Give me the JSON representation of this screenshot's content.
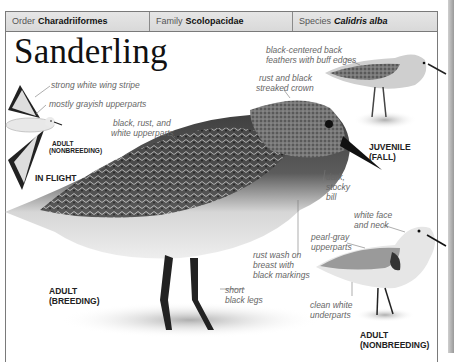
{
  "header": {
    "order_label": "Order",
    "order_value": "Charadriiformes",
    "family_label": "Family",
    "family_value": "Scolopacidae",
    "species_label": "Species",
    "species_value": "Calidris alba"
  },
  "title": "Sanderling",
  "figures": {
    "in_flight": {
      "caption_age": "ADULT",
      "caption_plumage": "(NONBREEDING)",
      "caption": "IN FLIGHT",
      "labels": [
        "strong white wing stripe",
        "mostly grayish upperparts"
      ]
    },
    "adult_breeding": {
      "caption_line1": "ADULT",
      "caption_line2": "(BREEDING)",
      "labels": {
        "upperparts_1": "black, rust, and",
        "upperparts_2": "white upperparts",
        "crown_1": "rust and black",
        "crown_2": "streaked crown",
        "bill_1": "dark,",
        "bill_2": "stocky",
        "bill_3": "bill",
        "breast_1": "rust wash on",
        "breast_2": "breast with",
        "breast_3": "black markings",
        "legs_1": "short",
        "legs_2": "black legs"
      }
    },
    "juvenile": {
      "caption_line1": "JUVENILE",
      "caption_line2": "(FALL)",
      "labels": {
        "back_1": "black-centered back",
        "back_2": "feathers with buff edges"
      }
    },
    "adult_nonbreeding": {
      "caption_line1": "ADULT",
      "caption_line2": "(NONBREEDING)",
      "labels": {
        "face_1": "white face",
        "face_2": "and neck",
        "upper_1": "pearl-gray",
        "upper_2": "upperparts",
        "under_1": "clean white",
        "under_2": "underparts"
      }
    }
  }
}
